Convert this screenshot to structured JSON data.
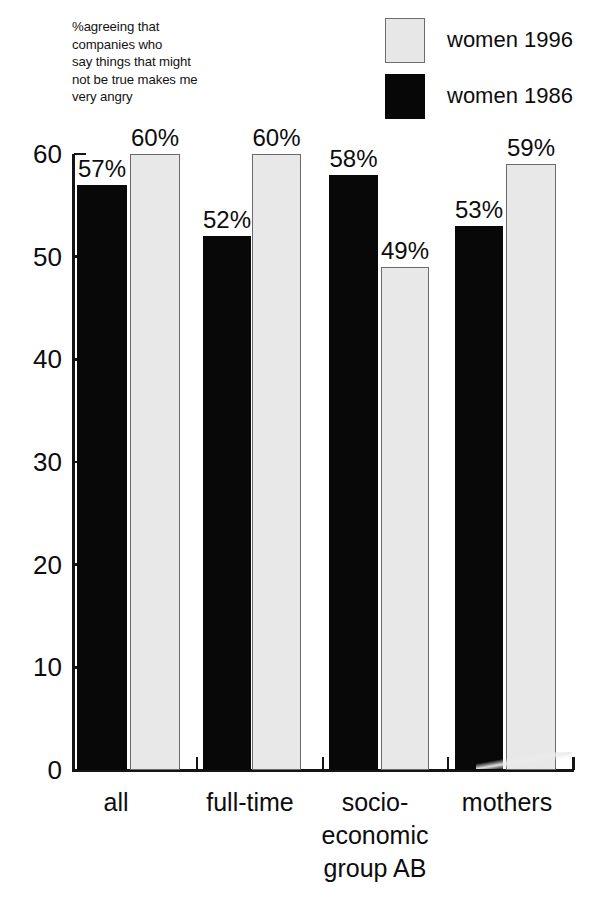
{
  "caption": {
    "lines": [
      "%agreeing that",
      "companies who",
      "say things that might",
      "not be true makes me",
      "very angry"
    ]
  },
  "legend": {
    "items": [
      {
        "label": "women 1996",
        "swatch": "light-gray-square",
        "color": "#e7e7e7"
      },
      {
        "label": "women 1986",
        "swatch": "black-square",
        "color": "#070707"
      }
    ]
  },
  "chart_data": {
    "type": "bar",
    "title": "%agreeing that companies who say things that might not be true makes me very angry",
    "xlabel": "",
    "ylabel": "",
    "ylim": [
      0,
      60
    ],
    "yticks": [
      0,
      10,
      20,
      30,
      40,
      50,
      60
    ],
    "ytick_labels": [
      "0",
      "10",
      "20",
      "30",
      "40",
      "50",
      "60"
    ],
    "grid": false,
    "legend_position": "top-right",
    "categories": [
      "all",
      "full-time",
      "socio-\neconomic\ngroup AB",
      "mothers"
    ],
    "category_labels_flat": [
      "all",
      "full-time",
      "socio-economic group AB",
      "mothers"
    ],
    "series": [
      {
        "name": "women 1986",
        "color": "#080808",
        "values": [
          57,
          52,
          58,
          53
        ],
        "data_labels": [
          "57%",
          "52%",
          "58%",
          "53%"
        ]
      },
      {
        "name": "women 1996",
        "color": "#e8e8e8",
        "values": [
          60,
          60,
          49,
          59
        ],
        "data_labels": [
          "60%",
          "60%",
          "49%",
          "59%"
        ]
      }
    ]
  }
}
